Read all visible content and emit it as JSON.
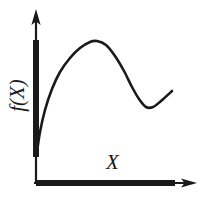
{
  "figure": {
    "title": "",
    "background_color": "#ffffff",
    "ink_color": "#1a1a1a",
    "width": 207,
    "height": 200
  },
  "labels": {
    "y_axis": "f(X)",
    "x_axis": "X"
  },
  "icons": {
    "y_axis_arrow": "arrow-up-icon",
    "x_axis_arrow": "arrow-right-icon"
  },
  "chart_data": {
    "type": "line",
    "title": "",
    "xlabel": "X",
    "ylabel": "f(X)",
    "grid": false,
    "legend": null,
    "axes": {
      "origin_px": [
        36,
        183
      ],
      "x_axis": {
        "from_px": [
          36,
          183
        ],
        "to_px": [
          196,
          183
        ],
        "arrow": true,
        "emphasis_segment_px": [
          36,
          175
        ],
        "emphasis_thickness_px": 6
      },
      "y_axis": {
        "from_px": [
          36,
          183
        ],
        "to_px": [
          36,
          10
        ],
        "arrow": true,
        "emphasis_segment_px": [
          157,
          40
        ],
        "emphasis_thickness_px": 6
      }
    },
    "series": [
      {
        "name": "f(X)",
        "stroke": "#1a1a1a",
        "stroke_width_px": 2.6,
        "points_px": [
          [
            37,
            152
          ],
          [
            40,
            132
          ],
          [
            45,
            110
          ],
          [
            52,
            89
          ],
          [
            60,
            72
          ],
          [
            70,
            58
          ],
          [
            80,
            48
          ],
          [
            90,
            42
          ],
          [
            97,
            41
          ],
          [
            106,
            45
          ],
          [
            115,
            56
          ],
          [
            124,
            71
          ],
          [
            132,
            87
          ],
          [
            139,
            99
          ],
          [
            146,
            107
          ],
          [
            153,
            107
          ],
          [
            161,
            101
          ],
          [
            172,
            91
          ]
        ],
        "shape_description": "rises steeply from near origin to a rounded maximum, falls to a rounded minimum, then rises again"
      }
    ],
    "annotations": [
      {
        "name": "local-maximum",
        "x_px": 96,
        "y_px": 41
      },
      {
        "name": "local-minimum",
        "x_px": 147,
        "y_px": 108
      }
    ]
  }
}
